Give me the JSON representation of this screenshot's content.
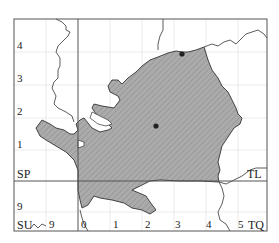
{
  "map": {
    "grid_squares": [
      "SP",
      "TL",
      "SU",
      "TQ"
    ],
    "y_ticks_left": [
      "4",
      "3",
      "2",
      "1",
      "9"
    ],
    "x_ticks_bottom": [
      "9",
      "0",
      "1",
      "2",
      "3",
      "4",
      "5"
    ],
    "points": [
      {
        "name": "record-1",
        "x": 182,
        "y": 54
      },
      {
        "name": "record-2",
        "x": 156,
        "y": 126
      }
    ],
    "colors": {
      "fill": "#a9a9a9",
      "hatch": "#8a8a8a",
      "line": "#333333",
      "grid": "#e4e4e4",
      "frame": "#555555"
    }
  }
}
